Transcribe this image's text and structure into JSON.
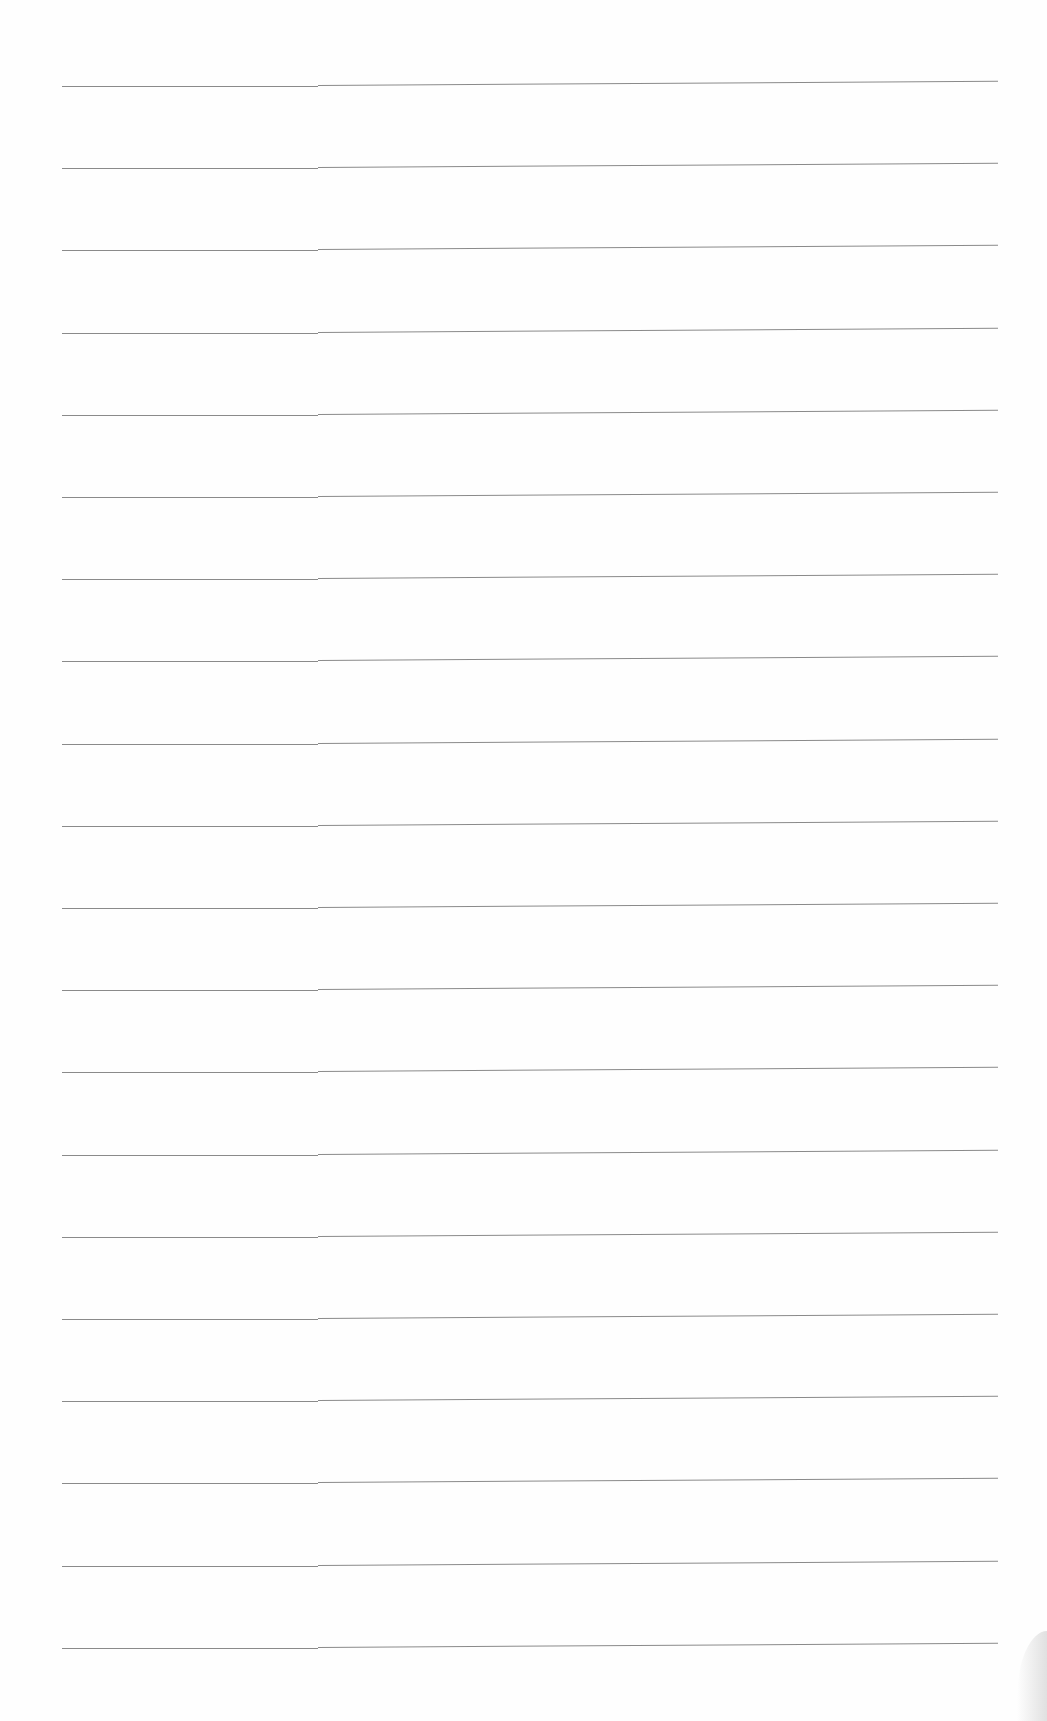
{
  "page": {
    "type": "blank ruled notebook paper",
    "background_color": "#ffffff",
    "rule_color": "#8a8a8a",
    "rule_count": 20,
    "first_rule_y": 85,
    "rule_spacing": 82.2,
    "rule_left_x": 62,
    "rule_right_x": 998,
    "text_content": ""
  }
}
